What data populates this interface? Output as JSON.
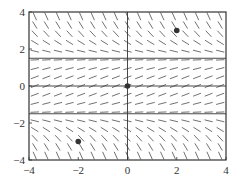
{
  "chart_data": {
    "type": "slope_field",
    "title": "",
    "xlabel": "",
    "ylabel": "",
    "xlim": [
      -4,
      4
    ],
    "ylim": [
      -4,
      4
    ],
    "grid": false,
    "x_ticks": [
      -4,
      -2,
      0,
      2,
      4
    ],
    "y_ticks": [
      4,
      2,
      0,
      -2,
      -4
    ],
    "x_tick_labels": [
      "−4",
      "−2",
      "0",
      "2",
      "4"
    ],
    "y_tick_labels": [
      "4",
      "2",
      "0",
      "−2",
      "−4"
    ],
    "equilibrium_lines_y": [
      1.5,
      0,
      -1.5
    ],
    "vertical_axis_x": 0,
    "marked_points": [
      {
        "x": 2,
        "y": 3
      },
      {
        "x": 0,
        "y": 0
      },
      {
        "x": -2,
        "y": -3
      }
    ],
    "slope_field": {
      "description": "slopes negative for |y|>1.5, positive for |y|<1.5",
      "x_count": 17,
      "y_count": 17,
      "slope_formula": "k*(2.25 - y^2)",
      "k": 0.25
    }
  },
  "colors": {
    "line": "#333333",
    "point": "#333333",
    "background": "#ffffff"
  }
}
